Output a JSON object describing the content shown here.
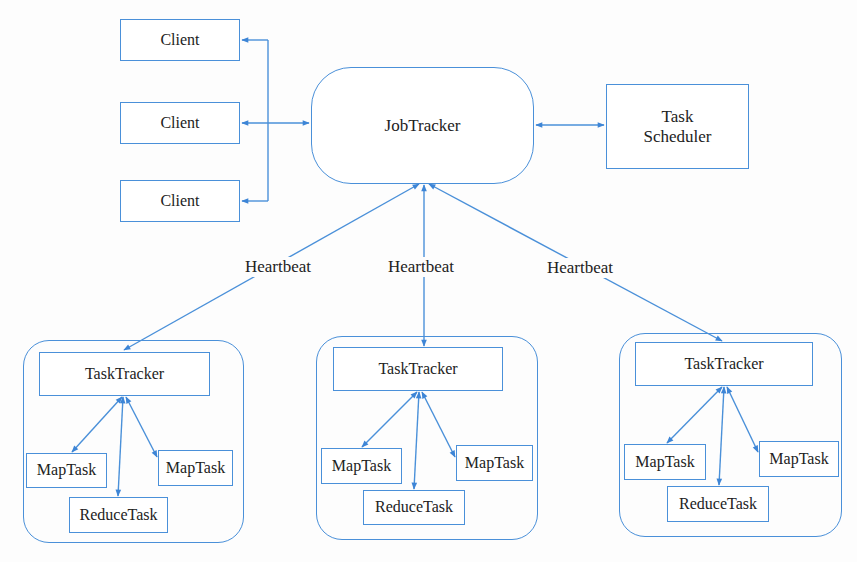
{
  "diagram": {
    "title": "",
    "type": "Hadoop MapReduce v1 architecture",
    "colors": {
      "line": "#4a90d9",
      "text": "#222222",
      "background": "#fdfdfd"
    },
    "clients": [
      {
        "label": "Client"
      },
      {
        "label": "Client"
      },
      {
        "label": "Client"
      }
    ],
    "jobtracker": {
      "label": "JobTracker"
    },
    "scheduler": {
      "line1": "Task",
      "line2": "Scheduler"
    },
    "heartbeats": [
      {
        "label": "Heartbeat"
      },
      {
        "label": "Heartbeat"
      },
      {
        "label": "Heartbeat"
      }
    ],
    "nodes": [
      {
        "tasktracker": "TaskTracker",
        "map1": "MapTask",
        "map2": "MapTask",
        "reduce": "ReduceTask"
      },
      {
        "tasktracker": "TaskTracker",
        "map1": "MapTask",
        "map2": "MapTask",
        "reduce": "ReduceTask"
      },
      {
        "tasktracker": "TaskTracker",
        "map1": "MapTask",
        "map2": "MapTask",
        "reduce": "ReduceTask"
      }
    ],
    "edges": [
      {
        "from": "Client",
        "to": "JobTracker",
        "direction": "bidirectional"
      },
      {
        "from": "JobTracker",
        "to": "Task Scheduler",
        "direction": "bidirectional"
      },
      {
        "from": "JobTracker",
        "to": "TaskTracker (left)",
        "label": "Heartbeat",
        "direction": "bidirectional"
      },
      {
        "from": "JobTracker",
        "to": "TaskTracker (middle)",
        "label": "Heartbeat",
        "direction": "bidirectional"
      },
      {
        "from": "JobTracker",
        "to": "TaskTracker (right)",
        "label": "Heartbeat",
        "direction": "bidirectional"
      },
      {
        "from": "TaskTracker",
        "to": "MapTask",
        "direction": "bidirectional"
      },
      {
        "from": "TaskTracker",
        "to": "ReduceTask",
        "direction": "bidirectional"
      },
      {
        "from": "TaskTracker",
        "to": "MapTask",
        "direction": "bidirectional"
      }
    ]
  }
}
